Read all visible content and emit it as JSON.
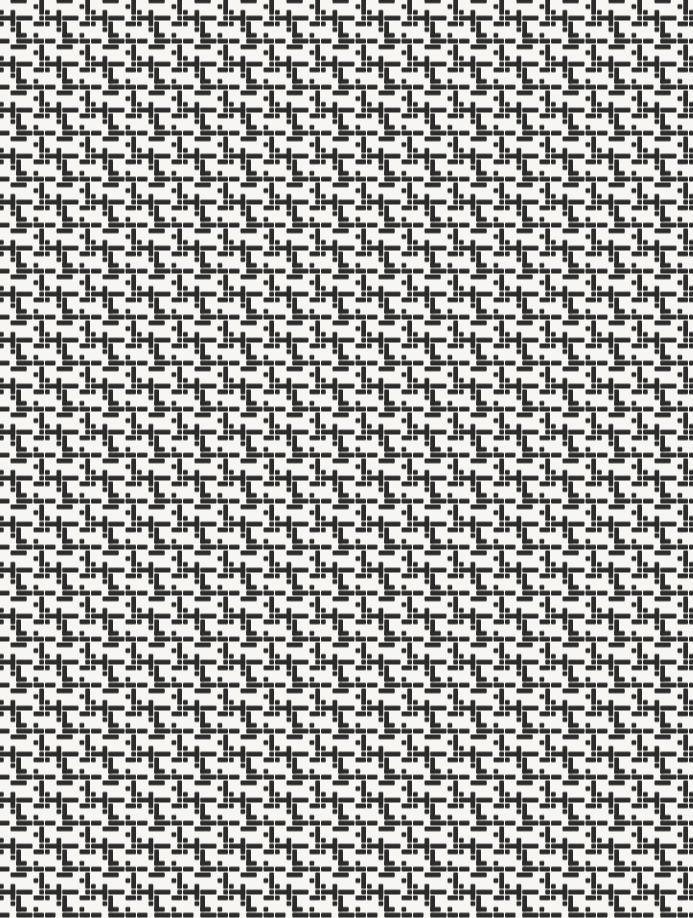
{
  "pattern": {
    "type": "basket-weave-dash-texture",
    "description": "Dense woven texture of dark rounded dashes (horizontal and vertical bars with square dots) interlocking like a basket weave on an off-white background",
    "background_color": "#f7f6f3",
    "dash_color": "#2b2b2b",
    "canvas_width": 693,
    "canvas_height": 918,
    "cell_size": 5.75,
    "dash_thickness": 4.75,
    "dash_gap": 1,
    "corner_radius": 1,
    "tile_cells": 8,
    "offset_x": -1,
    "offset_y": -1.5,
    "elements": [
      {
        "orient": "h",
        "col": 2,
        "row": 0,
        "len": 3
      },
      {
        "orient": "v",
        "col": 7,
        "row": 0,
        "len": 3
      },
      {
        "orient": "d",
        "col": 6,
        "row": 1,
        "len": 1
      },
      {
        "orient": "d",
        "col": 0,
        "row": 2,
        "len": 1
      },
      {
        "orient": "v",
        "col": 2,
        "row": 2,
        "len": 3
      },
      {
        "orient": "h",
        "col": 0,
        "row": 3,
        "len": 3
      },
      {
        "orient": "h",
        "col": 3,
        "row": 3,
        "len": 3
      },
      {
        "orient": "d",
        "col": 7,
        "row": 3,
        "len": 1
      },
      {
        "orient": "d",
        "col": 0,
        "row": 4,
        "len": 1
      },
      {
        "orient": "v",
        "col": 3,
        "row": 4,
        "len": 3
      },
      {
        "orient": "h",
        "col": 6,
        "row": 4,
        "len": 2
      },
      {
        "orient": "d",
        "col": 2,
        "row": 5,
        "len": 1
      },
      {
        "orient": "h",
        "col": 3,
        "row": 6,
        "len": 2
      },
      {
        "orient": "d",
        "col": 6,
        "row": 6,
        "len": 1
      },
      {
        "orient": "h",
        "col": 0,
        "row": 7,
        "len": 2
      },
      {
        "orient": "h",
        "col": 3,
        "row": 7,
        "len": 3
      },
      {
        "orient": "h",
        "col": 6,
        "row": 7,
        "len": 2
      }
    ]
  }
}
